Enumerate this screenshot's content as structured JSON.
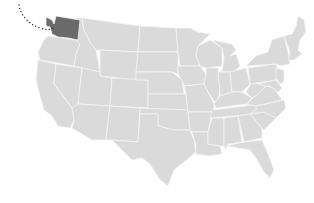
{
  "map": {
    "title": "United States",
    "base_color": "#dadada",
    "border_color": "#f4f4f4",
    "highlight_color": "#6a6a6a",
    "highlighted_state": "Washington",
    "route": {
      "style": "dotted",
      "color": "#333333",
      "from": "off-map northwest",
      "to": "Washington"
    }
  }
}
